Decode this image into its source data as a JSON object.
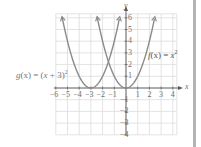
{
  "chart_data": {
    "type": "line",
    "title": "",
    "xlabel": "x",
    "ylabel": "y",
    "xlim": [
      -6,
      4.5
    ],
    "ylim": [
      -4,
      6
    ],
    "grid": true,
    "x_ticks": [
      -6,
      -5,
      -4,
      -3,
      -2,
      -1,
      1,
      2,
      3,
      4
    ],
    "y_ticks": [
      -4,
      -3,
      -2,
      -1,
      1,
      2,
      3,
      4,
      5,
      6
    ],
    "series": [
      {
        "name": "f(x) = x^2",
        "formula": "x^2",
        "x": [
          -2.5,
          -2,
          -1,
          0,
          1,
          2,
          2.5
        ],
        "y": [
          6.25,
          4,
          1,
          0,
          1,
          4,
          6.25
        ]
      },
      {
        "name": "g(x) = (x + 3)^2",
        "formula": "(x+3)^2",
        "x": [
          -5.5,
          -5,
          -4,
          -3,
          -2,
          -1,
          -0.5
        ],
        "y": [
          6.25,
          4,
          1,
          0,
          1,
          4,
          6.25
        ]
      }
    ],
    "annotations": [
      "f(x) = x²",
      "g(x) = (x + 3)²"
    ]
  },
  "labels": {
    "f": {
      "name": "f",
      "arg": "(x)",
      "eq": " = ",
      "rhs": "x",
      "sup": "2"
    },
    "g": {
      "name": "g",
      "arg": "(x)",
      "eq": " = (",
      "rhs": "x",
      "mid": " + 3)",
      "sup": "2"
    },
    "x_axis": "x",
    "y_axis": "y",
    "xticks": [
      "−6",
      "−5",
      "−4",
      "−3",
      "−2",
      "−1",
      "1",
      "2",
      "3",
      "4"
    ],
    "yticks": [
      "6",
      "5",
      "4",
      "3",
      "2",
      "1",
      "−1",
      "−2",
      "−3",
      "−4"
    ]
  },
  "colors": {
    "curve": "#8a8a8a",
    "grid": "#dcdcdc",
    "axis": "#5a5a5a",
    "text": "#6e6e6e"
  }
}
